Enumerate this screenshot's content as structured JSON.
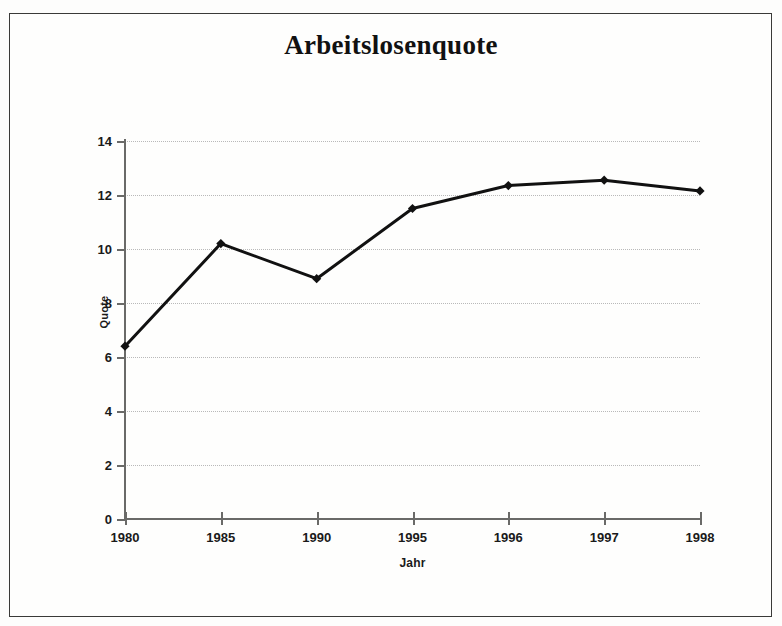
{
  "chart_data": {
    "type": "line",
    "title": "Arbeitslosenquote",
    "xlabel": "Jahr",
    "ylabel": "Quote",
    "categories": [
      "1980",
      "1985",
      "1990",
      "1995",
      "1996",
      "1997",
      "1998"
    ],
    "values": [
      6.4,
      10.2,
      8.9,
      11.5,
      12.35,
      12.55,
      12.15
    ],
    "series": [
      {
        "name": "Arbeitslosenquote",
        "values": [
          6.4,
          10.2,
          8.9,
          11.5,
          12.35,
          12.55,
          12.15
        ]
      }
    ],
    "ylim": [
      0,
      14
    ],
    "ytick_labels": [
      "14",
      "12",
      "10",
      "8",
      "6",
      "4",
      "2",
      "0"
    ],
    "ytick_values": [
      14,
      12,
      10,
      8,
      6,
      4,
      2,
      0
    ],
    "grid": "horizontal-dotted",
    "legend": "none",
    "line_color": "#111111",
    "marker": "diamond",
    "marker_color": "#111111"
  },
  "frame": {
    "border_color": "#3a3a38"
  }
}
